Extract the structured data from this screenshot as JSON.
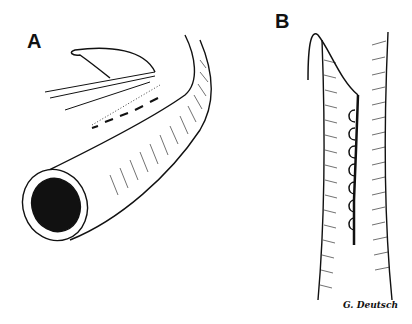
{
  "figure": {
    "panels": [
      {
        "label": "A",
        "description": "Oblique view of vessel tube with forceps and suture, interrupted stitches along incision"
      },
      {
        "label": "B",
        "description": "Vertical vessel segment with continuous suture line"
      }
    ],
    "signature": "G. Deutsch"
  },
  "colors": {
    "ink": "#111111",
    "paper": "#ffffff"
  }
}
